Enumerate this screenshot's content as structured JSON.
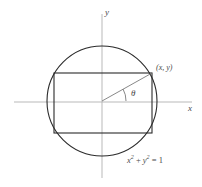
{
  "figure": {
    "background_color": "#ffffff",
    "axes": {
      "x_label": "x",
      "y_label": "y",
      "axis_color": "#b9b9b9",
      "x_axis": {
        "x1": 14,
        "y1": 102,
        "x2": 192,
        "y2": 102
      },
      "y_axis": {
        "x1": 102,
        "y1": 14,
        "x2": 102,
        "y2": 178
      }
    },
    "circle": {
      "center_x": 102,
      "center_y": 101,
      "radius": 55,
      "stroke_color": "#2b2b2b",
      "equation": "x² + y² = 1"
    },
    "rectangle": {
      "left": 54,
      "top": 73,
      "right": 152,
      "bottom": 133,
      "stroke_color": "#2b2b2b"
    },
    "radius_segment": {
      "from_x": 102,
      "from_y": 101,
      "to_x": 152,
      "to_y": 73,
      "stroke_color": "#7a7a7a"
    },
    "angle_arc": {
      "label": "θ",
      "label_x": 131,
      "label_y": 90,
      "radius": 24,
      "stroke_color": "#7a7a7a"
    },
    "labels": {
      "point": "(x, y)",
      "point_x": 156,
      "point_y": 67,
      "x_axis_label_x": 188,
      "x_axis_label_y": 107,
      "y_axis_label_x": 105,
      "y_axis_label_y": 12,
      "equation_parts": {
        "x_var": "x",
        "x_exp": "2",
        "plus": " + ",
        "y_var": "y",
        "y_exp": "2",
        "equals": " = 1"
      },
      "equation_x": 127,
      "equation_y": 158
    }
  }
}
